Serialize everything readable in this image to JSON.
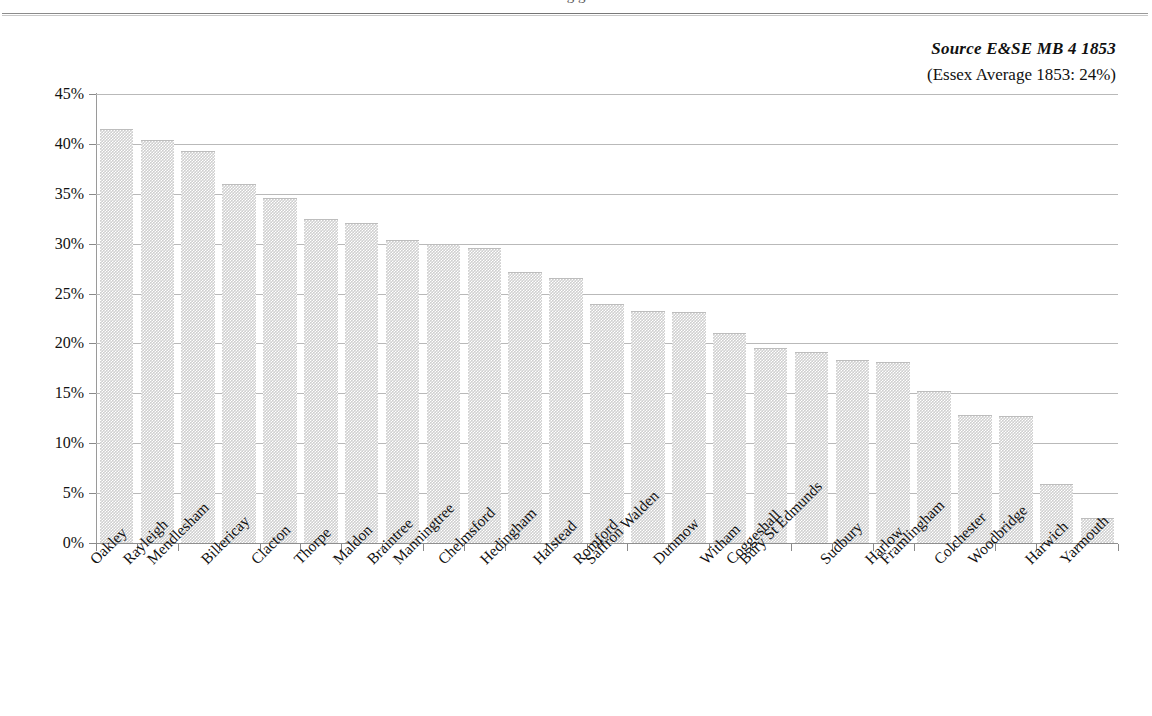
{
  "page": {
    "cut_title_fragment": "g                                                                                                g"
  },
  "annotations": {
    "source": "Source E&SE MB 4 1853",
    "average_note": "(Essex Average 1853: 24%)"
  },
  "chart_data": {
    "type": "bar",
    "title": "",
    "subtitle": "",
    "xlabel": "",
    "ylabel": "",
    "ylim": [
      0,
      45
    ],
    "ytick_labels": [
      "0%",
      "5%",
      "10%",
      "15%",
      "20%",
      "25%",
      "30%",
      "35%",
      "40%",
      "45%"
    ],
    "ytick_values": [
      0,
      5,
      10,
      15,
      20,
      25,
      30,
      35,
      40,
      45
    ],
    "grid": true,
    "legend": "none",
    "value_suffix": "%",
    "bar_color": "#cfcfcf",
    "gridline_color": "#b9b9b9",
    "axis_color": "#8f8f8f",
    "categories": [
      "Oakley",
      "Rayleigh",
      "Mendlesham",
      "Billericay",
      "Clacton",
      "Thorpe",
      "Maldon",
      "Braintree",
      "Manningtree",
      "Chelmsford",
      "Hedingham",
      "Halstead",
      "Romford",
      "Saffron Walden",
      "Dunmow",
      "Witham",
      "Coggeshall",
      "Bury St Edmunds",
      "Sudbury",
      "Harlow",
      "Framlingham",
      "Colchester",
      "Woodbridge",
      "Harwich",
      "Yarmouth"
    ],
    "values": [
      41.4,
      40.3,
      39.2,
      35.9,
      34.5,
      32.4,
      32.0,
      30.3,
      29.9,
      29.5,
      27.1,
      26.5,
      23.9,
      23.2,
      23.1,
      20.9,
      19.4,
      19.0,
      18.2,
      18.0,
      15.1,
      12.7,
      12.6,
      5.8,
      2.4
    ]
  }
}
